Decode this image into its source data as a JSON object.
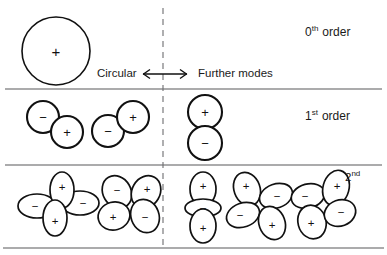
{
  "figure": {
    "background_color": "#ffffff",
    "line_color": "#58585a",
    "stroke_color": "#111111"
  },
  "labels": {
    "circular": "Circular",
    "further_modes": "Further modes",
    "order_0_number": "0",
    "order_0_suffix": "th",
    "order_0_word": "order",
    "order_1_number": "1",
    "order_1_suffix": "st",
    "order_1_word": "order",
    "order_2_number": "2",
    "order_2_suffix": "nd"
  },
  "signs": {
    "plus": "+",
    "minus": "−"
  },
  "rows": [
    {
      "name": "zeroth-order",
      "order_label": "0th order",
      "left_group": [
        {
          "name": "circular-mode",
          "lobes": [
            {
              "sign": "+"
            }
          ]
        }
      ],
      "right_group": []
    },
    {
      "name": "first-order",
      "order_label": "1st order",
      "left_group": [
        {
          "name": "dipole-diagonal-a",
          "lobes": [
            {
              "sign": "−"
            },
            {
              "sign": "+"
            }
          ]
        },
        {
          "name": "dipole-diagonal-b",
          "lobes": [
            {
              "sign": "−"
            },
            {
              "sign": "+"
            }
          ]
        }
      ],
      "right_group": [
        {
          "name": "dipole-vertical",
          "lobes": [
            {
              "sign": "+"
            },
            {
              "sign": "−"
            }
          ]
        }
      ]
    },
    {
      "name": "second-order",
      "order_label": "2nd",
      "left_group": [
        {
          "name": "quadrupole-cross",
          "lobes": [
            {
              "sign": "−"
            },
            {
              "sign": "+"
            },
            {
              "sign": "+"
            },
            {
              "sign": "−"
            }
          ]
        },
        {
          "name": "quadrupole-diagonal",
          "lobes": [
            {
              "sign": "−"
            },
            {
              "sign": "+"
            },
            {
              "sign": "+"
            },
            {
              "sign": "−"
            }
          ]
        }
      ],
      "right_group": [
        {
          "name": "triple-lobe-vertical",
          "lobes": [
            {
              "sign": "+"
            },
            {
              "sign": "−"
            },
            {
              "sign": "+"
            }
          ]
        },
        {
          "name": "quadrupole-tilted-a",
          "lobes": [
            {
              "sign": "+"
            },
            {
              "sign": "−"
            },
            {
              "sign": "−"
            },
            {
              "sign": "+"
            }
          ]
        },
        {
          "name": "quadrupole-tilted-b",
          "lobes": [
            {
              "sign": "−"
            },
            {
              "sign": "+"
            },
            {
              "sign": "+"
            },
            {
              "sign": "−"
            }
          ]
        }
      ]
    }
  ]
}
